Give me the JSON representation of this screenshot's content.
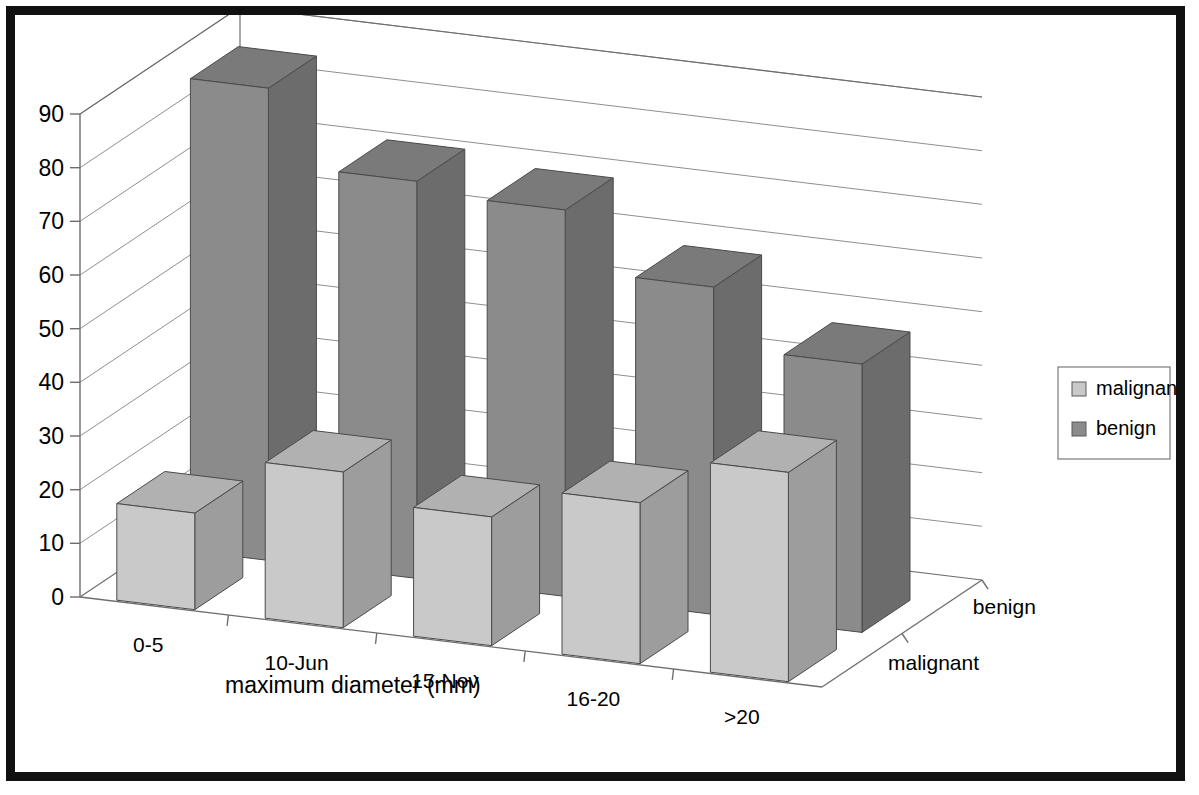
{
  "chart_data": {
    "type": "bar",
    "subtype": "3d-grouped-bar",
    "title": "",
    "xlabel": "maximum diameter (mm)",
    "ylabel": "",
    "zlabel": "",
    "categories": [
      "0-5",
      "10-Jun",
      "15-Nov",
      "16-20",
      ">20"
    ],
    "series": [
      {
        "name": "malignant",
        "values": [
          18,
          29,
          24,
          30,
          39
        ],
        "color": "#c9c9c9"
      },
      {
        "name": "benign",
        "values": [
          88,
          74,
          72,
          61,
          50
        ],
        "color": "#8b8b8b"
      }
    ],
    "depth_axis_categories": [
      "malignant",
      "benign"
    ],
    "ylim": [
      0,
      90
    ],
    "ytick_values": [
      "0",
      "10",
      "20",
      "30",
      "40",
      "50",
      "60",
      "70",
      "80",
      "90"
    ],
    "grid": true,
    "legend_position": "right",
    "legend_entries": [
      "malignant",
      "benign"
    ],
    "plot_background": "#ffffff",
    "gridline_color": "#8f8f8f",
    "frame_color": "#111111"
  },
  "axis": {
    "x_title": "maximum diameter (mm)"
  },
  "depth": {
    "front_label": "malignant",
    "back_label": "benign"
  },
  "legend": {
    "items": [
      {
        "label": "malignant",
        "swatch": "#c9c9c9"
      },
      {
        "label": "benign",
        "swatch": "#8b8b8b"
      }
    ]
  }
}
